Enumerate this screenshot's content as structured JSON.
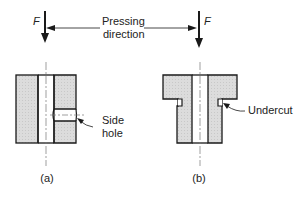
{
  "diagram": {
    "force_label": "F",
    "pressing_label_line1": "Pressing",
    "pressing_label_line2": "direction",
    "parts": [
      {
        "id": "a",
        "caption": "(a)",
        "feature_label_line1": "Side",
        "feature_label_line2": "hole"
      },
      {
        "id": "b",
        "caption": "(b)",
        "feature_label_line1": "Undercut",
        "feature_label_line2": ""
      }
    ],
    "colors": {
      "fill": "#d9d9d9",
      "stroke": "#1a1a1a",
      "background": "#ffffff"
    }
  }
}
